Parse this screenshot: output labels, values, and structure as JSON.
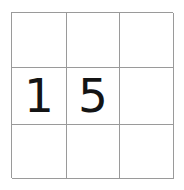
{
  "puzzle": {
    "title": "3x3 number grid",
    "rows": 3,
    "columns": 3,
    "grid_line_color": "#9a9a9a",
    "background_color": "#ffffff",
    "digit_color": "#141414",
    "cells": [
      {
        "id": "r1c1",
        "row": 1,
        "col": 1,
        "value": ""
      },
      {
        "id": "r1c2",
        "row": 1,
        "col": 2,
        "value": ""
      },
      {
        "id": "r1c3",
        "row": 1,
        "col": 3,
        "value": ""
      },
      {
        "id": "r2c1",
        "row": 2,
        "col": 1,
        "value": "1"
      },
      {
        "id": "r2c2",
        "row": 2,
        "col": 2,
        "value": "5"
      },
      {
        "id": "r2c3",
        "row": 2,
        "col": 3,
        "value": ""
      },
      {
        "id": "r3c1",
        "row": 3,
        "col": 1,
        "value": ""
      },
      {
        "id": "r3c2",
        "row": 3,
        "col": 2,
        "value": ""
      },
      {
        "id": "r3c3",
        "row": 3,
        "col": 3,
        "value": ""
      }
    ]
  }
}
